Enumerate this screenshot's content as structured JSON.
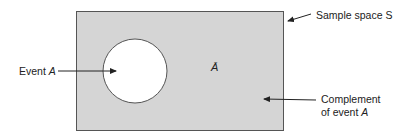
{
  "diagram": {
    "type": "venn",
    "sample_space_label": "Sample space S",
    "event_label_prefix": "Event ",
    "event_symbol": "A",
    "complement_symbol": "Ā",
    "complement_label_line1": "Complement",
    "complement_label_line2_prefix": "of event ",
    "complement_label_line2_symbol": "A",
    "colors": {
      "sample_space_fill": "#d5d5d5",
      "event_fill": "#ffffff",
      "stroke": "#555555",
      "text": "#222222"
    }
  }
}
